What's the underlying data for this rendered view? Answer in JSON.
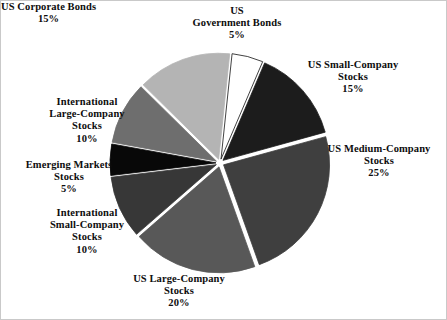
{
  "figure": {
    "background_color": "#ffffff",
    "border_color": "#c9c9c9",
    "separator_color": "#ffffff"
  },
  "chart_data": {
    "type": "pie",
    "title": "",
    "subtitle": "",
    "xlabel": "",
    "ylabel": "",
    "legend_position": "none",
    "grid": false,
    "exploded": true,
    "start_angle_deg": -84,
    "direction": "clockwise",
    "total_percent": 100,
    "categories": [
      "US Government Bonds",
      "US Small-Company Stocks",
      "US Medium-Company Stocks",
      "US Large-Company Stocks",
      "International Small-Company Stocks",
      "Emerging Markets Stocks",
      "International Large-Company Stocks",
      "US Corporate Bonds"
    ],
    "values": [
      5,
      15,
      25,
      20,
      10,
      5,
      10,
      15
    ],
    "value_labels": [
      "5%",
      "15%",
      "25%",
      "20%",
      "10%",
      "5%",
      "10%",
      "15%"
    ],
    "colors": [
      "#ffffff",
      "#1c1c1c",
      "#3f3f3f",
      "#585858",
      "#373737",
      "#080808",
      "#6e6e6e",
      "#b4b4b4"
    ],
    "slices": [
      {
        "name": "us-government-bonds",
        "label_lines": [
          "US",
          "Government Bonds"
        ],
        "percent_label": "5%",
        "value": 5,
        "color": "#ffffff",
        "outline": "#111111"
      },
      {
        "name": "us-small-company-stocks",
        "label_lines": [
          "US Small-Company",
          "Stocks"
        ],
        "percent_label": "15%",
        "value": 15,
        "color": "#1c1c1c",
        "outline": "#1c1c1c"
      },
      {
        "name": "us-medium-company-stocks",
        "label_lines": [
          "US Medium-Company",
          "Stocks"
        ],
        "percent_label": "25%",
        "value": 25,
        "color": "#3f3f3f",
        "outline": "#3f3f3f"
      },
      {
        "name": "us-large-company-stocks",
        "label_lines": [
          "US Large-Company",
          "Stocks"
        ],
        "percent_label": "20%",
        "value": 20,
        "color": "#585858",
        "outline": "#585858"
      },
      {
        "name": "international-small-company-stocks",
        "label_lines": [
          "International",
          "Small-Company",
          "Stocks"
        ],
        "percent_label": "10%",
        "value": 10,
        "color": "#373737",
        "outline": "#373737"
      },
      {
        "name": "emerging-markets-stocks",
        "label_lines": [
          "Emerging Markets",
          "Stocks"
        ],
        "percent_label": "5%",
        "value": 5,
        "color": "#080808",
        "outline": "#080808"
      },
      {
        "name": "international-large-company-stocks",
        "label_lines": [
          "International",
          "Large-Company",
          "Stocks"
        ],
        "percent_label": "10%",
        "value": 10,
        "color": "#6e6e6e",
        "outline": "#6e6e6e"
      },
      {
        "name": "us-corporate-bonds",
        "label_lines": [
          "US Corporate Bonds"
        ],
        "percent_label": "15%",
        "value": 15,
        "color": "#b4b4b4",
        "outline": "#b4b4b4"
      }
    ]
  },
  "labels": {
    "us_government_bonds": {
      "line1": "US",
      "line2": "Government Bonds",
      "percent": "5%"
    },
    "us_small_company": {
      "line1": "US Small-Company",
      "line2": "Stocks",
      "percent": "15%"
    },
    "us_medium_company": {
      "line1": "US Medium-Company",
      "line2": "Stocks",
      "percent": "25%"
    },
    "us_large_company": {
      "line1": "US Large-Company",
      "line2": "Stocks",
      "percent": "20%"
    },
    "intl_small_company": {
      "line1": "International",
      "line2": "Small-Company",
      "line3": "Stocks",
      "percent": "10%"
    },
    "emerging_markets": {
      "line1": "Emerging Markets",
      "line2": "Stocks",
      "percent": "5%"
    },
    "intl_large_company": {
      "line1": "International",
      "line2": "Large-Company",
      "line3": "Stocks",
      "percent": "10%"
    },
    "us_corporate_bonds": {
      "line1": "US Corporate Bonds",
      "percent": "15%"
    }
  }
}
